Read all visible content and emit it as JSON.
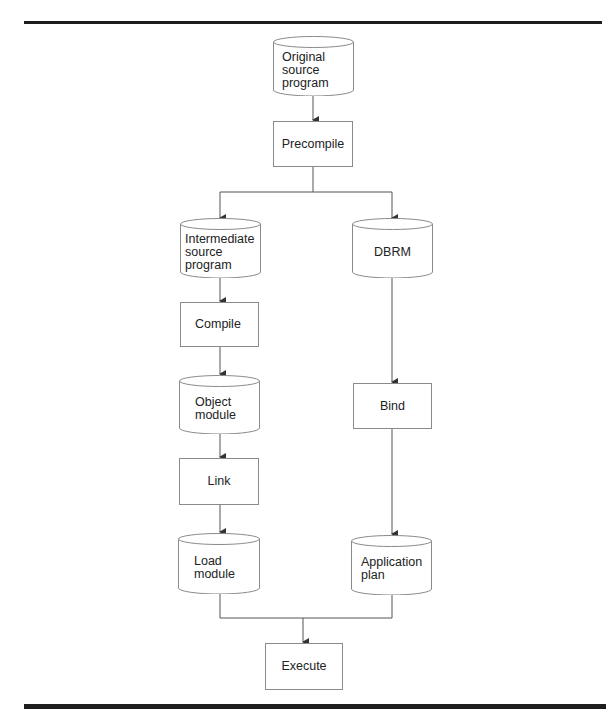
{
  "diagram": {
    "type": "flowchart",
    "colors": {
      "line": "#555555",
      "border": "#8a8a8a",
      "text": "#222222",
      "rule": "#1e1e1e"
    },
    "nodes": [
      {
        "id": "original_source",
        "shape": "cylinder",
        "label": "Original\nsource\nprogram"
      },
      {
        "id": "precompile",
        "shape": "box",
        "label": "Precompile"
      },
      {
        "id": "intermediate_source",
        "shape": "cylinder",
        "label": "Intermediate\nsource\nprogram"
      },
      {
        "id": "dbrm",
        "shape": "cylinder",
        "label": "DBRM"
      },
      {
        "id": "compile",
        "shape": "box",
        "label": "Compile"
      },
      {
        "id": "object_module",
        "shape": "cylinder",
        "label": "Object\nmodule"
      },
      {
        "id": "bind",
        "shape": "box",
        "label": "Bind"
      },
      {
        "id": "link",
        "shape": "box",
        "label": "Link"
      },
      {
        "id": "load_module",
        "shape": "cylinder",
        "label": "Load\nmodule"
      },
      {
        "id": "application_plan",
        "shape": "cylinder",
        "label": "Application\nplan"
      },
      {
        "id": "execute",
        "shape": "box",
        "label": "Execute"
      }
    ],
    "edges": [
      {
        "from": "original_source",
        "to": "precompile"
      },
      {
        "from": "precompile",
        "to": "intermediate_source"
      },
      {
        "from": "precompile",
        "to": "dbrm"
      },
      {
        "from": "intermediate_source",
        "to": "compile"
      },
      {
        "from": "compile",
        "to": "object_module"
      },
      {
        "from": "object_module",
        "to": "link"
      },
      {
        "from": "link",
        "to": "load_module"
      },
      {
        "from": "dbrm",
        "to": "bind"
      },
      {
        "from": "bind",
        "to": "application_plan"
      },
      {
        "from": "load_module",
        "to": "execute"
      },
      {
        "from": "application_plan",
        "to": "execute"
      }
    ]
  }
}
